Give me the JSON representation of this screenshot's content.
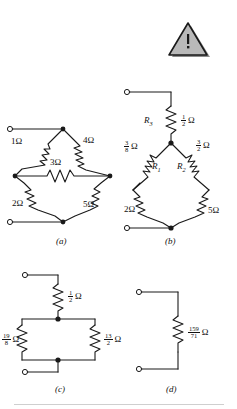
{
  "figure": {
    "background": "#ffffff",
    "line_color": "#1a1a1a",
    "caption_color": "#111111"
  },
  "warning_icon": {
    "name": "warning-triangle-icon",
    "glyph": "!",
    "fill": "#b3b3b3",
    "stroke": "#1a1a1a",
    "shadow": "#808080"
  },
  "subfigures": [
    {
      "id": "a",
      "caption": "(a)"
    },
    {
      "id": "b",
      "caption": "(b)"
    },
    {
      "id": "c",
      "caption": "(c)"
    },
    {
      "id": "d",
      "caption": "(d)"
    }
  ],
  "circuit_a": {
    "caption": "(a)",
    "labels": [
      {
        "name": "resistor-label-1ohm",
        "value": "1",
        "unit": "Ω",
        "x": 11,
        "y": 142
      },
      {
        "name": "resistor-label-4ohm",
        "value": "4",
        "unit": "Ω",
        "x": 82,
        "y": 141
      },
      {
        "name": "resistor-label-3ohm",
        "value": "3",
        "unit": "Ω",
        "x": 48,
        "y": 162
      },
      {
        "name": "resistor-label-2ohm",
        "value": "2",
        "unit": "Ω",
        "x": 12,
        "y": 203
      },
      {
        "name": "resistor-label-5ohm",
        "value": "5",
        "unit": "Ω",
        "x": 82,
        "y": 204
      }
    ]
  },
  "circuit_b": {
    "caption": "(b)",
    "labels": [
      {
        "name": "resistor-name-R3",
        "value": "R",
        "sub": "3",
        "x": 145,
        "y": 121
      },
      {
        "name": "resistor-label-half-ohm",
        "num": "1",
        "den": "2",
        "unit": "Ω",
        "x": 166,
        "y": 118
      },
      {
        "name": "resistor-label-three-eighths-ohm",
        "num": "3",
        "den": "8",
        "unit": "Ω",
        "x": 126,
        "y": 144
      },
      {
        "name": "resistor-label-three-halves-ohm",
        "num": "3",
        "den": "2",
        "unit": "Ω",
        "x": 192,
        "y": 143
      },
      {
        "name": "resistor-name-R1",
        "value": "R",
        "sub": "1",
        "x": 154,
        "y": 163
      },
      {
        "name": "resistor-name-R2",
        "value": "R",
        "sub": "2",
        "x": 177,
        "y": 163
      },
      {
        "name": "resistor-label-2ohm",
        "value": "2",
        "unit": "Ω",
        "x": 126,
        "y": 205
      },
      {
        "name": "resistor-label-5ohm",
        "value": "5",
        "unit": "Ω",
        "x": 198,
        "y": 206
      }
    ]
  },
  "circuit_c": {
    "caption": "(c)",
    "labels": [
      {
        "name": "resistor-label-half-ohm",
        "num": "1",
        "den": "2",
        "unit": "Ω",
        "x": 66,
        "y": 293
      },
      {
        "name": "resistor-label-nineteen-eighths-ohm",
        "num": "19",
        "den": "8",
        "unit": "Ω",
        "x": 9,
        "y": 337
      },
      {
        "name": "resistor-label-thirteen-halves-ohm",
        "num": "13",
        "den": "2",
        "unit": "Ω",
        "x": 88,
        "y": 337
      }
    ]
  },
  "circuit_d": {
    "caption": "(d)",
    "labels": [
      {
        "name": "resistor-label-159-71-ohm",
        "num": "159",
        "den": "71",
        "unit": "Ω",
        "x": 188,
        "y": 330
      }
    ]
  }
}
